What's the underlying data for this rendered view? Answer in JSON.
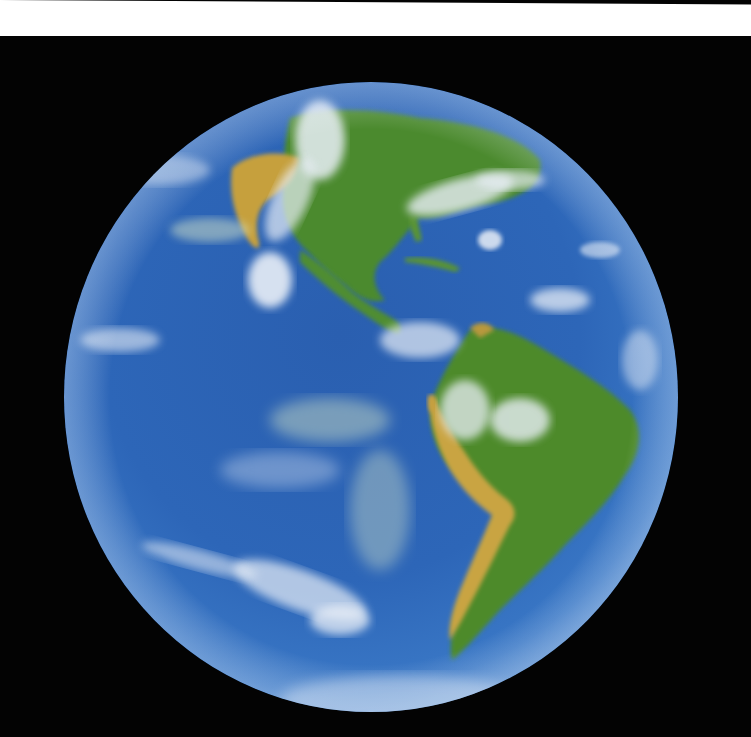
{
  "image": {
    "subject": "Planet Earth viewed from space showing the Americas",
    "caption": "Earth — Western Hemisphere",
    "regions": [
      {
        "name": "North America",
        "description": "green landmass with arid tan western region"
      },
      {
        "name": "Central America",
        "description": "narrow land bridge with Caribbean islands"
      },
      {
        "name": "South America",
        "description": "green Amazon basin with tan Andes along west coast"
      },
      {
        "name": "Pacific Ocean",
        "description": "deep blue ocean with swirling white clouds"
      },
      {
        "name": "Atlantic Ocean",
        "description": "blue ocean with scattered clouds"
      }
    ],
    "colors": {
      "ocean": "#2f68b8",
      "ocean_deep": "#1c3f86",
      "land_green": "#4f8a2c",
      "land_tan": "#c9a242",
      "cloud": "#e8eef6",
      "space": "#030303",
      "top_strip": "#ffffff"
    }
  }
}
